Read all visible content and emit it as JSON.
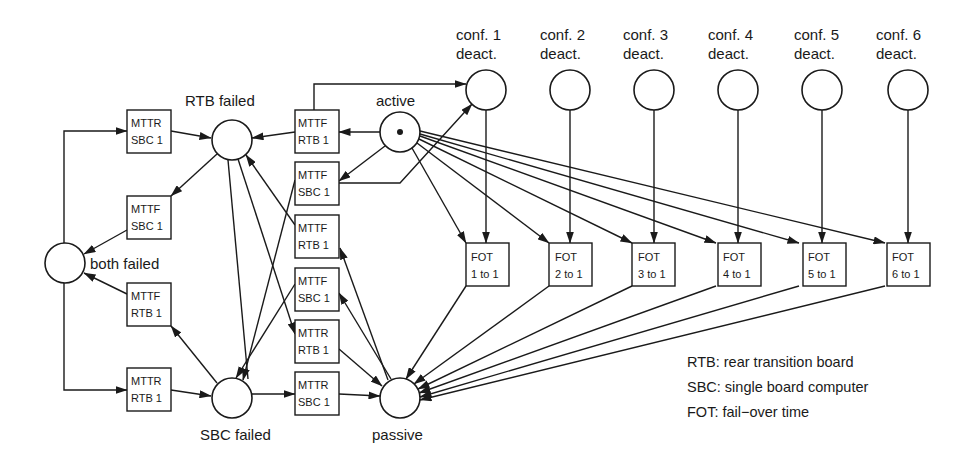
{
  "diagram": {
    "type": "petri-net",
    "places": {
      "both_failed": {
        "label": "both failed",
        "tokens": 0
      },
      "rtb_failed": {
        "label": "RTB failed",
        "tokens": 0
      },
      "sbc_failed": {
        "label": "SBC failed",
        "tokens": 0
      },
      "active": {
        "label": "active",
        "tokens": 1
      },
      "passive": {
        "label": "passive",
        "tokens": 0
      },
      "conf": [
        {
          "line1": "conf. 1",
          "line2": "deact."
        },
        {
          "line1": "conf. 2",
          "line2": "deact."
        },
        {
          "line1": "conf. 3",
          "line2": "deact."
        },
        {
          "line1": "conf. 4",
          "line2": "deact."
        },
        {
          "line1": "conf. 5",
          "line2": "deact."
        },
        {
          "line1": "conf. 6",
          "line2": "deact."
        }
      ]
    },
    "transitions": {
      "left": [
        {
          "line1": "MTTR",
          "line2": "SBC 1"
        },
        {
          "line1": "MTTF",
          "line2": "SBC 1"
        },
        {
          "line1": "MTTF",
          "line2": "RTB 1"
        },
        {
          "line1": "MTTR",
          "line2": "RTB 1"
        }
      ],
      "middle": [
        {
          "line1": "MTTF",
          "line2": "RTB 1"
        },
        {
          "line1": "MTTF",
          "line2": "SBC 1"
        },
        {
          "line1": "MTTF",
          "line2": "RTB 1"
        },
        {
          "line1": "MTTF",
          "line2": "SBC 1"
        },
        {
          "line1": "MTTR",
          "line2": "RTB 1"
        },
        {
          "line1": "MTTR",
          "line2": "SBC 1"
        }
      ],
      "fot": [
        {
          "line1": "FOT",
          "line2": "1 to 1"
        },
        {
          "line1": "FOT",
          "line2": "2 to 1"
        },
        {
          "line1": "FOT",
          "line2": "3 to 1"
        },
        {
          "line1": "FOT",
          "line2": "4 to 1"
        },
        {
          "line1": "FOT",
          "line2": "5 to 1"
        },
        {
          "line1": "FOT",
          "line2": "6 to 1"
        }
      ]
    },
    "legend": [
      "RTB: rear transition board",
      "SBC: single board computer",
      "FOT: fail−over  time"
    ]
  }
}
